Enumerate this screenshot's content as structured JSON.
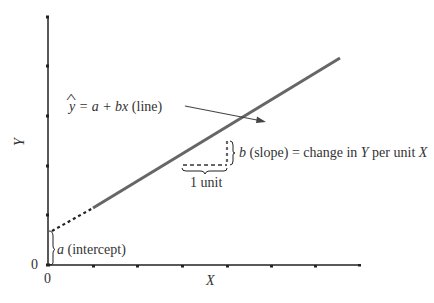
{
  "diagram": {
    "axes": {
      "x_label": "X",
      "y_label": "Y",
      "x_origin_label": "0",
      "y_origin_label": "0",
      "x_tick_count": 8,
      "y_tick_count": 6
    },
    "line_equation": {
      "yhat": "y",
      "hat": "^",
      "rhs": " = a + bx",
      "suffix": " (line)"
    },
    "intercept_label": {
      "symbol": "a",
      "text": " (intercept)"
    },
    "slope_label": {
      "symbol": "b",
      "text1": " (slope) = change in ",
      "y": "Y",
      "text2": " per unit ",
      "x": "X"
    },
    "unit_label": "1 unit",
    "colors": {
      "axis": "#222222",
      "line": "#666666",
      "text": "#333333"
    }
  }
}
